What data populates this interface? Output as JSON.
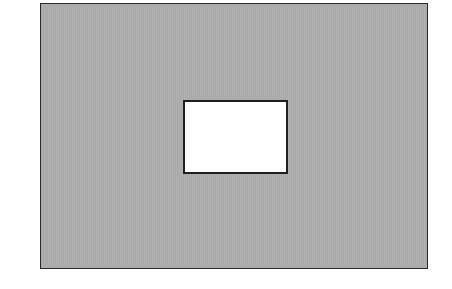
{
  "diagram": {
    "type": "rectangle-with-hole",
    "outer_rect": {
      "fill": "#acacac",
      "stroke": "#2a2a2a"
    },
    "inner_rect": {
      "fill": "#ffffff",
      "stroke": "#1e1e1e"
    }
  }
}
